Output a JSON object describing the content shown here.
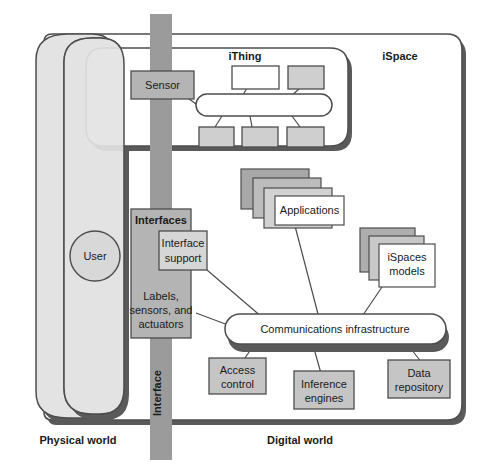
{
  "diagram": {
    "regions": {
      "physical_world_label": "Physical world",
      "digital_world_label": "Digital world",
      "ispace_label": "iSpace",
      "ithing_label": "iThing",
      "interface_band_label": "Interface"
    },
    "nodes": {
      "user": "User",
      "sensor": "Sensor",
      "interfaces_title": "Interfaces",
      "interface_support": [
        "Interface",
        "support"
      ],
      "labels_sensors_actuators": [
        "Labels,",
        "sensors, and",
        "actuators"
      ],
      "applications": "Applications",
      "ispaces_models": [
        "iSpaces",
        "models"
      ],
      "communications_infrastructure": "Communications infrastructure",
      "access_control": [
        "Access",
        "control"
      ],
      "inference_engines": [
        "Inference",
        "engines"
      ],
      "data_repository": [
        "Data",
        "repository"
      ]
    },
    "colors": {
      "stroke": "#4d4d4d",
      "shadow": "#5a5a5a",
      "band_gray": "#9b9b9b",
      "dark_gray": "#a8a8a8",
      "mid_gray": "#bcbcbc",
      "light_gray": "#cfcfcf",
      "pale_gray": "#dcdcdc",
      "oval_fill": "#e3e3e3",
      "white": "#ffffff",
      "text": "#1a1a1a"
    }
  }
}
